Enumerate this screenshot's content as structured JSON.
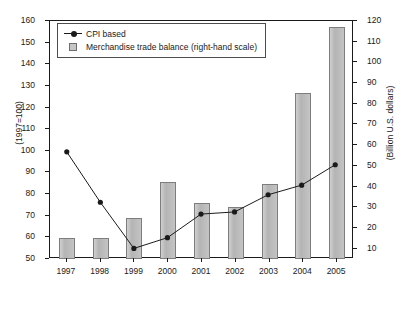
{
  "chart_data": {
    "type": "bar",
    "title": "",
    "subtitle": "",
    "categories": [
      "1997",
      "1998",
      "1999",
      "2000",
      "2001",
      "2002",
      "2003",
      "2004",
      "2005"
    ],
    "xlabel": "",
    "ylabel": "(1997=100)",
    "y2label": "(Billion U.S. dollars)",
    "ylim": [
      50,
      160
    ],
    "y2lim": [
      5,
      120
    ],
    "yticks": [
      50,
      60,
      70,
      80,
      90,
      100,
      110,
      120,
      130,
      140,
      150,
      160
    ],
    "y2ticks": [
      10,
      20,
      30,
      40,
      50,
      60,
      70,
      80,
      90,
      100,
      110,
      120
    ],
    "grid": false,
    "legend_position": "top-left",
    "series": [
      {
        "name": "CPI based",
        "type": "line",
        "axis": "left",
        "marker": "filled-circle",
        "color": "#1a1a1a",
        "values": [
          99,
          75.5,
          54,
          59,
          70,
          71,
          79,
          83.5,
          93
        ]
      },
      {
        "name": "Merchandise trade balance (right-hand scale)",
        "type": "bar",
        "axis": "right",
        "color": "#bcbcbc",
        "values": [
          15,
          15,
          25,
          42,
          32,
          30,
          41,
          85,
          117
        ]
      }
    ]
  },
  "legend": {
    "items": [
      {
        "label": "CPI based",
        "key": "line-marker-key"
      },
      {
        "label": "Merchandise trade balance (right-hand scale)",
        "key": "square-swatch-key"
      }
    ]
  },
  "axes": {
    "left_title": "(1997=100)",
    "right_title": "(Billion U.S. dollars)",
    "left_ticks": [
      "160",
      "150",
      "140",
      "130",
      "120",
      "110",
      "100",
      "90",
      "80",
      "70",
      "60",
      "50"
    ],
    "right_ticks": [
      "120",
      "110",
      "100",
      "90",
      "80",
      "70",
      "60",
      "50",
      "40",
      "30",
      "20",
      "10"
    ],
    "x_ticks": [
      "1997",
      "1998",
      "1999",
      "2000",
      "2001",
      "2002",
      "2003",
      "2004",
      "2005"
    ]
  }
}
